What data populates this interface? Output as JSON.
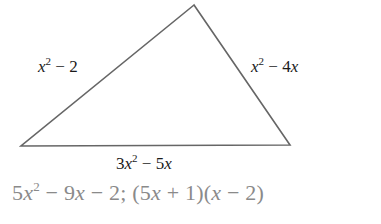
{
  "figure": {
    "type": "triangle",
    "vertices": {
      "apex": [
        194,
        5
      ],
      "bottom_left": [
        21,
        146
      ],
      "bottom_right": [
        290,
        145
      ]
    },
    "stroke_color": "#666666",
    "sides": {
      "left": {
        "var": "x",
        "exp": "2",
        "rest": " − 2"
      },
      "right": {
        "var": "x",
        "exp": "2",
        "rest": " − 4",
        "var2": "x"
      },
      "bottom": {
        "coef": "3",
        "var": "x",
        "exp": "2",
        "rest": " − 5",
        "var2": "x"
      }
    }
  },
  "answer": {
    "text_color": "#8a8a8a",
    "p1": "5",
    "v1": "x",
    "e1": "2",
    "p2": " − 9",
    "v2": "x",
    "p3": " − 2; (5",
    "v3": "x",
    "p4": " + 1)(",
    "v4": "x",
    "p5": " − 2)"
  }
}
